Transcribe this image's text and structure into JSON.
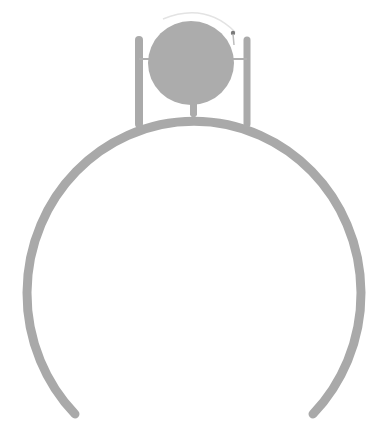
{
  "figure": {
    "colors": {
      "stroke": "#a9a9a9",
      "fill": "#acacac",
      "highlight": "#e3e3e3",
      "accent_dot": "#7a7a7a",
      "background": "#ffffff"
    }
  }
}
